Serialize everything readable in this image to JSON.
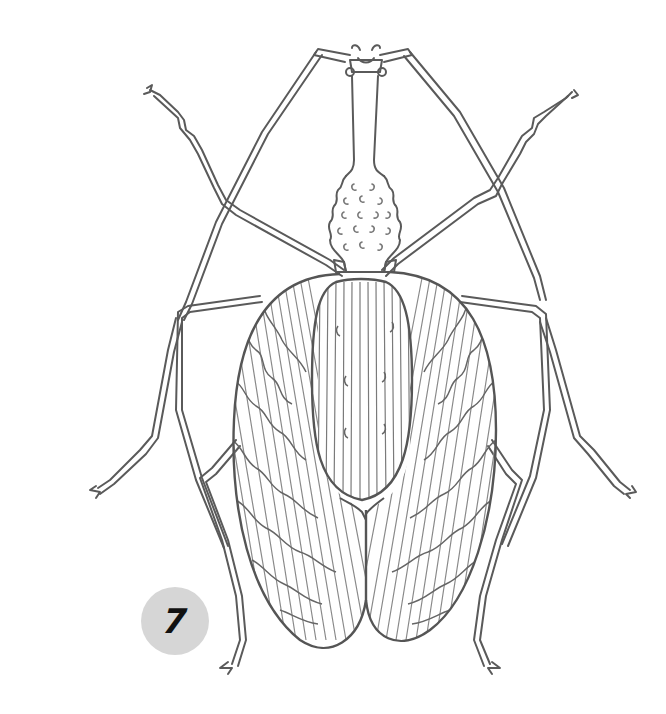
{
  "illustration": {
    "subject": "pencil line drawing of a long-legged insect (top view)",
    "badge": {
      "number": "7"
    },
    "colors": {
      "background": "#ffffff",
      "line": "#5a5a5a",
      "hatch": "#8a8a8a",
      "badge_fill": "#d6d6d6",
      "badge_text": "#111111"
    }
  }
}
